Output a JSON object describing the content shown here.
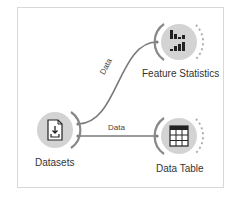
{
  "canvas": {
    "nodes": [
      {
        "id": "datasets",
        "label": "Datasets",
        "icon": "dataset-download-icon"
      },
      {
        "id": "feature-statistics",
        "label": "Feature Statistics",
        "icon": "bar-chart-icon"
      },
      {
        "id": "data-table",
        "label": "Data Table",
        "icon": "table-icon"
      }
    ],
    "links": [
      {
        "from": "datasets",
        "to": "feature-statistics",
        "label": "Data"
      },
      {
        "from": "datasets",
        "to": "data-table",
        "label": "Data"
      }
    ]
  },
  "colors": {
    "node_fill": "#d3d3d3",
    "link": "#7a7a7a",
    "frame_border": "#d8d8d8"
  }
}
